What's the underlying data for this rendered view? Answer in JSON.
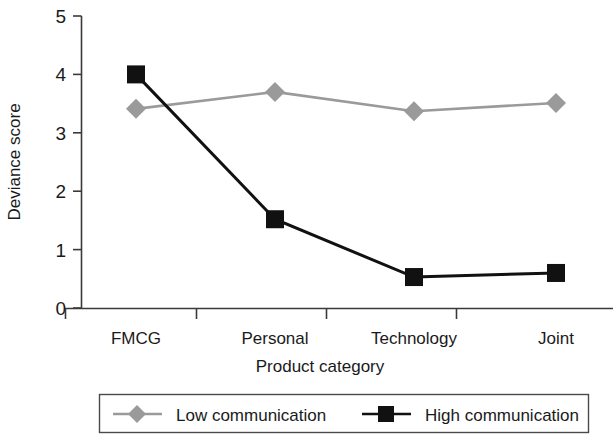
{
  "chart_data": {
    "type": "line",
    "title": "",
    "xlabel": "Product category",
    "ylabel": "Deviance score",
    "categories": [
      "FMCG",
      "Personal",
      "Technology",
      "Joint"
    ],
    "ylim": [
      0,
      5
    ],
    "yticks": [
      "0",
      "1",
      "2",
      "3",
      "4",
      "5"
    ],
    "grid": false,
    "legend_position": "bottom",
    "series": [
      {
        "name": "Low communication",
        "marker": "diamond",
        "color": "#9a9a9a",
        "values": [
          3.41,
          3.7,
          3.37,
          3.51
        ]
      },
      {
        "name": "High communication",
        "marker": "square",
        "color": "#111111",
        "values": [
          4.0,
          1.52,
          0.53,
          0.6
        ]
      }
    ]
  },
  "axes": {
    "y_title": "Deviance score",
    "x_title": "Product category",
    "y_tick_0": "0",
    "y_tick_1": "1",
    "y_tick_2": "2",
    "y_tick_3": "3",
    "y_tick_4": "4",
    "y_tick_5": "5",
    "x_cat_0": "FMCG",
    "x_cat_1": "Personal",
    "x_cat_2": "Technology",
    "x_cat_3": "Joint"
  },
  "legend": {
    "entry_low": "Low communication",
    "entry_high": "High communication"
  },
  "colors": {
    "low_series": "#9a9a9a",
    "high_series": "#111111",
    "axis": "#3a3a3a",
    "text": "#1a1a1a",
    "background": "#ffffff"
  }
}
